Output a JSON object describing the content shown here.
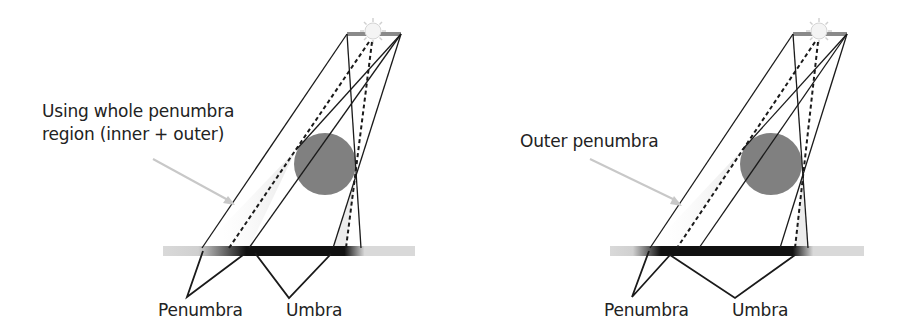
{
  "figure": {
    "panels": [
      {
        "id": "left",
        "annotation_line1": "Using whole penumbra",
        "annotation_line2": "region (inner + outer)",
        "label_penumbra": "Penumbra",
        "label_umbra": "Umbra",
        "highlighted_region": "inner + outer penumbra"
      },
      {
        "id": "right",
        "annotation_line1": "Outer penumbra",
        "label_penumbra": "Penumbra",
        "label_umbra": "Umbra",
        "highlighted_region": "outer penumbra"
      }
    ],
    "colors": {
      "occluder": "#808080",
      "lines": "#1a1a1a",
      "ground": "#d9d9d9",
      "shadow": "#0a0a0a",
      "arrow": "#c8c8c8",
      "sun": "#f4f4f4"
    }
  }
}
